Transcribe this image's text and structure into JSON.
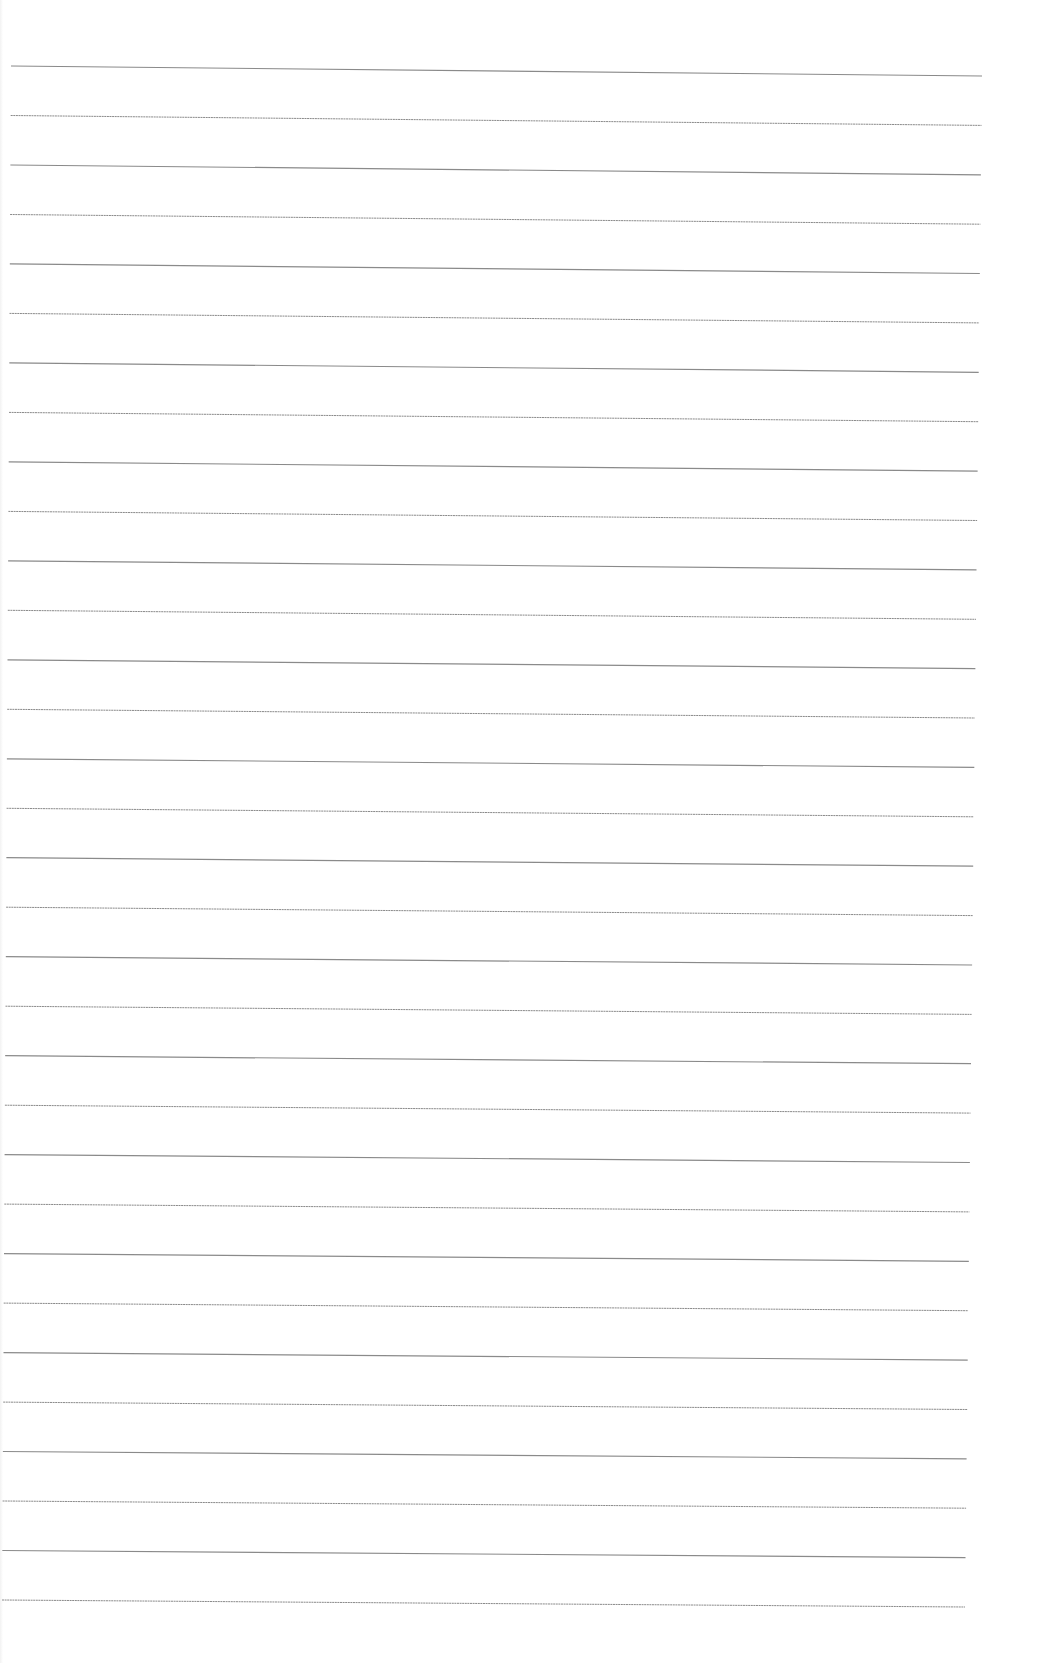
{
  "document": {
    "type": "ruled-paper",
    "background_color": "#ffffff",
    "rule_color": "#8a8a8a",
    "rule_count": 32,
    "rules": {
      "first": {
        "x1": 11,
        "y1": 66,
        "x2": 982,
        "y2": 76
      },
      "last": {
        "x1": 2,
        "y1": 1600,
        "x2": 965,
        "y2": 1607
      },
      "spacing": 49.5
    },
    "content": []
  }
}
